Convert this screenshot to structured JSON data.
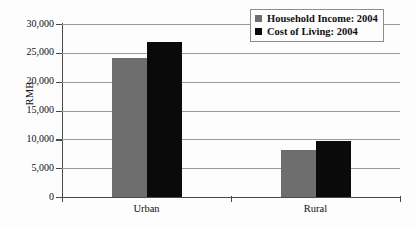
{
  "chart_data": {
    "type": "bar",
    "title": "",
    "xlabel": "",
    "ylabel": "RMB",
    "categories": [
      "Urban",
      "Rural"
    ],
    "series": [
      {
        "name": "Household Income: 2004",
        "color": "#6e6e6e",
        "values": [
          24100,
          8100
        ]
      },
      {
        "name": "Cost of Living: 2004",
        "color": "#0a0a0a",
        "values": [
          26800,
          9800
        ]
      }
    ],
    "ylim": [
      0,
      30000
    ],
    "ytick_values": [
      30000,
      25000,
      20000,
      15000,
      10000,
      5000,
      0
    ],
    "ytick_labels": [
      "30,000",
      "25,000",
      "20,000",
      "15,000",
      "10,000",
      "5,000",
      "0"
    ],
    "grid": true,
    "legend_position": "top-right"
  },
  "legend": {
    "items": [
      {
        "label": "Household Income: 2004"
      },
      {
        "label": "Cost of Living: 2004"
      }
    ]
  }
}
